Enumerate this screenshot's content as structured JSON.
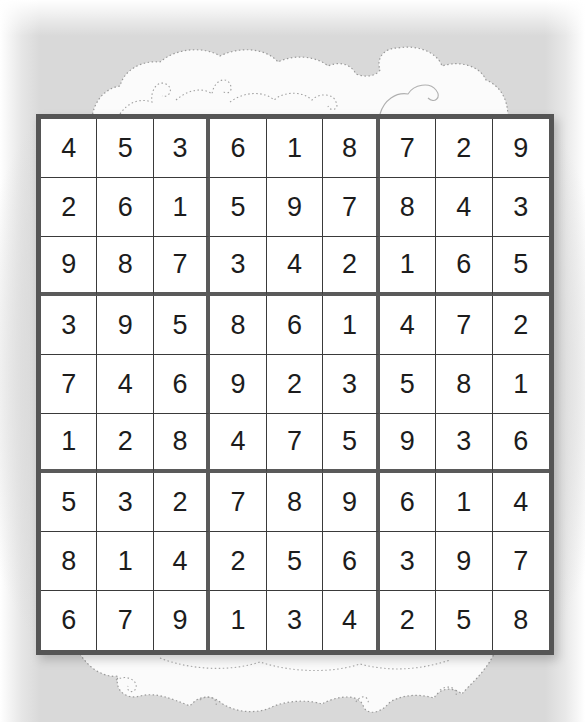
{
  "puzzle": {
    "type": "sudoku",
    "size": 9,
    "box_size": 3,
    "rows": [
      [
        "4",
        "5",
        "3",
        "6",
        "1",
        "8",
        "7",
        "2",
        "9"
      ],
      [
        "2",
        "6",
        "1",
        "5",
        "9",
        "7",
        "8",
        "4",
        "3"
      ],
      [
        "9",
        "8",
        "7",
        "3",
        "4",
        "2",
        "1",
        "6",
        "5"
      ],
      [
        "3",
        "9",
        "5",
        "8",
        "6",
        "1",
        "4",
        "7",
        "2"
      ],
      [
        "7",
        "4",
        "6",
        "9",
        "2",
        "3",
        "5",
        "8",
        "1"
      ],
      [
        "1",
        "2",
        "8",
        "4",
        "7",
        "5",
        "9",
        "3",
        "6"
      ],
      [
        "5",
        "3",
        "2",
        "7",
        "8",
        "9",
        "6",
        "1",
        "4"
      ],
      [
        "8",
        "1",
        "4",
        "2",
        "5",
        "6",
        "3",
        "9",
        "7"
      ],
      [
        "6",
        "7",
        "9",
        "1",
        "3",
        "4",
        "2",
        "5",
        "8"
      ]
    ]
  },
  "decorations": {
    "top": "cloud-icon",
    "bottom": "cloud-icon"
  },
  "colors": {
    "background": "#d9d9d9",
    "grid_border": "#555555",
    "cell_line": "#3a3a3a",
    "digit": "#1c1c1c",
    "cell_fill": "#ffffff"
  }
}
